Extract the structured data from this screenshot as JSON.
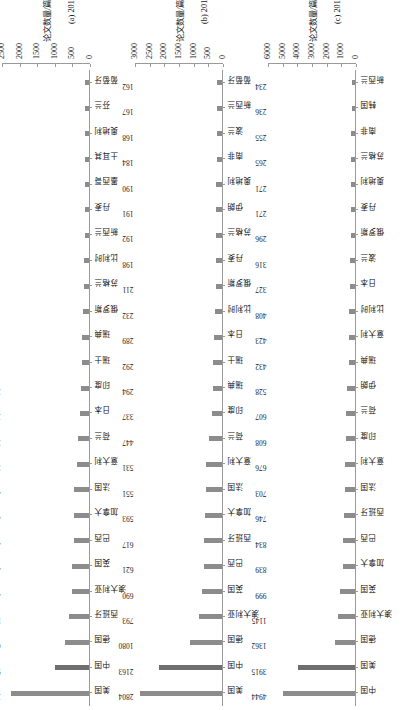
{
  "figure": {
    "orientation": "rotated-90-ccw",
    "bar_color": "#8c8c8c",
    "bar_color_highlight": "#6e6e6e",
    "axis_color": "#9a9a9a"
  },
  "chart_data": [
    {
      "type": "bar",
      "panel_id": "a",
      "title": "(a) 2010年",
      "xlabel": "论文数量/篇",
      "ylabel": "",
      "orientation": "vertical",
      "xlim": [
        0,
        2500
      ],
      "ticks": [
        0,
        500,
        1000,
        1500,
        2000,
        2500
      ],
      "tick_labels": [
        "0",
        "500",
        "1000",
        "1500",
        "2000",
        "2500"
      ],
      "grid": false,
      "legend": "none",
      "categories": [
        "美国",
        "中国",
        "德国",
        "西班牙",
        "澳大利亚",
        "英国",
        "巴西",
        "加拿大",
        "法国",
        "意大利",
        "荷兰",
        "日本",
        "印度",
        "瑞士",
        "瑞典",
        "俄罗斯",
        "苏格兰",
        "比利时",
        "新西兰",
        "丹麦",
        "墨西哥",
        "土耳其",
        "奥地利",
        "芬兰",
        "葡萄牙"
      ],
      "values": [
        2219,
        953,
        695,
        563,
        493,
        487,
        426,
        424,
        416,
        337,
        321,
        266,
        232,
        197,
        189,
        176,
        156,
        155,
        128,
        115,
        111,
        109,
        108,
        101,
        100
      ]
    },
    {
      "type": "bar",
      "panel_id": "b",
      "title": "(b) 2015年",
      "xlabel": "论文数量/篇",
      "ylabel": "",
      "orientation": "vertical",
      "xlim": [
        0,
        3000
      ],
      "ticks": [
        0,
        500,
        1000,
        1500,
        2000,
        2500,
        3000
      ],
      "tick_labels": [
        "0",
        "500",
        "1000",
        "1500",
        "2000",
        "2500",
        "3000"
      ],
      "grid": false,
      "legend": "none",
      "categories": [
        "美国",
        "中国",
        "德国",
        "澳大利亚",
        "英国",
        "巴西",
        "西班牙",
        "加拿大",
        "法国",
        "意大利",
        "荷兰",
        "印度",
        "瑞典",
        "瑞士",
        "日本",
        "比利时",
        "俄罗斯",
        "丹麦",
        "苏格兰",
        "伊朗",
        "奥地利",
        "南非",
        "波兰",
        "新西兰",
        "葡萄牙"
      ],
      "values": [
        2804,
        2163,
        1080,
        793,
        690,
        621,
        617,
        593,
        551,
        531,
        447,
        337,
        294,
        292,
        289,
        232,
        211,
        198,
        192,
        191,
        190,
        184,
        168,
        167,
        162
      ]
    },
    {
      "type": "bar",
      "panel_id": "c",
      "title": "(c) 2019年",
      "xlabel": "论文数量/篇",
      "ylabel": "",
      "orientation": "vertical",
      "xlim": [
        0,
        6000
      ],
      "ticks": [
        0,
        1000,
        2000,
        3000,
        4000,
        5000,
        6000
      ],
      "tick_labels": [
        "0",
        "1000",
        "2000",
        "3000",
        "4000",
        "5000",
        "6000"
      ],
      "grid": false,
      "legend": "none",
      "categories": [
        "中国",
        "美国",
        "德国",
        "澳大利亚",
        "英国",
        "加拿大",
        "巴西",
        "西班牙",
        "法国",
        "意大利",
        "印度",
        "荷兰",
        "伊朗",
        "瑞典",
        "意大利",
        "比利时",
        "日本",
        "波兰",
        "俄罗斯",
        "丹麦",
        "奥地利",
        "苏格兰",
        "南非",
        "韩国",
        "新西兰"
      ],
      "values": [
        4944,
        3915,
        1362,
        1145,
        999,
        839,
        834,
        746,
        703,
        676,
        608,
        607,
        528,
        432,
        423,
        408,
        327,
        316,
        296,
        271,
        271,
        265,
        255,
        236,
        234
      ]
    }
  ]
}
